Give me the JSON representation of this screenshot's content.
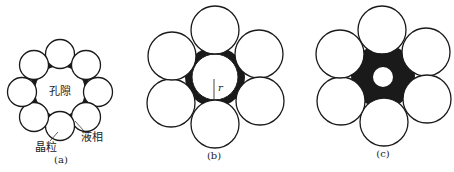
{
  "figure": {
    "panels": [
      {
        "id": "a",
        "caption": "(a)",
        "labels": {
          "pore": "孔隙",
          "grain": "晶粒",
          "liquid": "液相"
        },
        "grain_count": 8,
        "description": "Ring of 8 small grains around a large pore, liquid phase at grain necks"
      },
      {
        "id": "b",
        "caption": "(b)",
        "labels": {
          "radius": "r"
        },
        "grain_count": 6,
        "description": "Six grains around a pore of radius r, liquid phase filling cusps"
      },
      {
        "id": "c",
        "caption": "(c)",
        "grain_count": 6,
        "description": "Six grains with liquid phase filling interstice, small residual pore at center"
      }
    ],
    "colors": {
      "grain_fill": "#ffffff",
      "outline": "#1a1a1a",
      "liquid": "#1a1a1a",
      "background": "#ffffff"
    }
  }
}
